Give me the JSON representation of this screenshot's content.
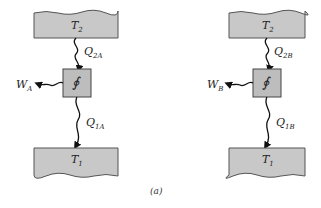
{
  "diagram": {
    "caption": "(a)",
    "engines": [
      {
        "id": "A",
        "hot_reservoir": {
          "label": "T",
          "sub": "2"
        },
        "cold_reservoir": {
          "label": "T",
          "sub": "1"
        },
        "heat_in": {
          "label": "Q",
          "sub": "2A"
        },
        "heat_out": {
          "label": "Q",
          "sub": "1A"
        },
        "work": {
          "label": "W",
          "sub": "A"
        },
        "engine_symbol": "∮"
      },
      {
        "id": "B",
        "hot_reservoir": {
          "label": "T",
          "sub": "2"
        },
        "cold_reservoir": {
          "label": "T",
          "sub": "1"
        },
        "heat_in": {
          "label": "Q",
          "sub": "2B"
        },
        "heat_out": {
          "label": "Q",
          "sub": "1B"
        },
        "work": {
          "label": "W",
          "sub": "B"
        },
        "engine_symbol": "∮"
      }
    ],
    "colors": {
      "reservoir_fill": "#c8c8c8",
      "engine_fill": "#bdbdbd",
      "stroke": "#333333"
    }
  }
}
